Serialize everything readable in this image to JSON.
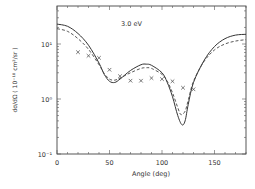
{
  "chart_data": {
    "type": "line",
    "title": "",
    "annotation": "3.0 eV",
    "xlabel": "Angle (deg)",
    "ylabel": "dσ/dΩ ( 10⁻¹⁸ cm²/sr )",
    "xlim": [
      0,
      180
    ],
    "ylim": [
      0.1,
      50
    ],
    "yscale": "log",
    "grid": false,
    "legend": null,
    "xticks": [
      {
        "value": 0,
        "label": "0"
      },
      {
        "value": 50,
        "label": "50"
      },
      {
        "value": 100,
        "label": "100"
      },
      {
        "value": 150,
        "label": "150"
      }
    ],
    "yticks": [
      {
        "value": 0.1,
        "label": "10⁻¹"
      },
      {
        "value": 1,
        "label": "10⁰"
      },
      {
        "value": 10,
        "label": "10¹"
      }
    ],
    "series": [
      {
        "name": "theory-solid",
        "style": "solid",
        "x": [
          0,
          10,
          20,
          30,
          40,
          45,
          50,
          55,
          60,
          70,
          80,
          85,
          90,
          100,
          105,
          110,
          115,
          119,
          122,
          125,
          130,
          140,
          150,
          160,
          170,
          180
        ],
        "y": [
          23,
          21,
          15.5,
          9.5,
          4.5,
          2.8,
          2.1,
          2.0,
          2.3,
          3.3,
          4.2,
          4.3,
          4.1,
          3.0,
          2.0,
          1.1,
          0.5,
          0.34,
          0.4,
          0.8,
          2.0,
          5.0,
          9.0,
          12.5,
          14.5,
          15
        ]
      },
      {
        "name": "theory-dashed",
        "style": "dashed",
        "x": [
          0,
          10,
          20,
          30,
          40,
          45,
          50,
          55,
          60,
          70,
          80,
          85,
          90,
          100,
          105,
          110,
          115,
          118,
          122,
          125,
          130,
          140,
          150,
          160,
          170,
          180
        ],
        "y": [
          19,
          17,
          12.5,
          8.0,
          4.2,
          2.9,
          2.3,
          2.2,
          2.4,
          3.0,
          3.6,
          3.7,
          3.6,
          2.8,
          2.1,
          1.3,
          0.7,
          0.52,
          0.6,
          0.95,
          2.1,
          4.8,
          7.8,
          10.0,
          11.3,
          12
        ]
      },
      {
        "name": "experiment",
        "style": "x-markers",
        "x": [
          20,
          30,
          40,
          50,
          60,
          70,
          80,
          90,
          100,
          110,
          120,
          130
        ],
        "y": [
          7.1,
          6.1,
          5.6,
          3.4,
          2.6,
          2.15,
          2.15,
          2.4,
          2.3,
          2.1,
          1.6,
          1.5
        ]
      }
    ]
  }
}
